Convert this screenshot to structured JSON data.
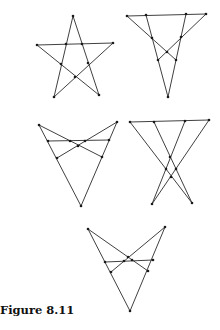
{
  "caption": "Figure 8.11",
  "colors": {
    "line": "#2a2a2a",
    "point": "#1a1a1a",
    "background": "#ffffff"
  },
  "figures": [
    {
      "name": "pentagram",
      "lines": [
        [
          73,
          16,
          54,
          97
        ],
        [
          73,
          16,
          99,
          95
        ],
        [
          37,
          45,
          113,
          43
        ],
        [
          37,
          45,
          99,
          95
        ],
        [
          54,
          97,
          113,
          43
        ]
      ],
      "points": [
        [
          73,
          16
        ],
        [
          37,
          45
        ],
        [
          113,
          43
        ],
        [
          54,
          97
        ],
        [
          99,
          95
        ],
        [
          66,
          44
        ],
        [
          82,
          44
        ],
        [
          61,
          64
        ],
        [
          88,
          63
        ],
        [
          75,
          77
        ]
      ]
    },
    {
      "name": "inverted-triangle-crossed",
      "lines": [
        [
          127,
          16,
          206,
          14
        ],
        [
          146,
          15,
          168,
          97
        ],
        [
          186,
          14,
          168,
          97
        ],
        [
          127,
          16,
          176,
          60
        ],
        [
          206,
          14,
          158,
          60
        ]
      ],
      "points": [
        [
          127,
          16
        ],
        [
          146,
          15
        ],
        [
          186,
          14
        ],
        [
          206,
          14
        ],
        [
          152,
          38
        ],
        [
          181,
          37
        ],
        [
          167,
          52
        ],
        [
          158,
          60
        ],
        [
          176,
          60
        ],
        [
          168,
          97
        ]
      ]
    },
    {
      "name": "bowtie-triangle-left",
      "lines": [
        [
          39,
          125,
          81,
          206
        ],
        [
          117,
          122,
          81,
          206
        ],
        [
          48,
          141,
          109,
          140
        ],
        [
          39,
          125,
          102,
          157
        ],
        [
          117,
          122,
          57,
          158
        ]
      ],
      "points": [
        [
          39,
          125
        ],
        [
          117,
          122
        ],
        [
          48,
          141
        ],
        [
          109,
          140
        ],
        [
          70,
          141
        ],
        [
          85,
          141
        ],
        [
          78,
          146
        ],
        [
          57,
          158
        ],
        [
          102,
          157
        ],
        [
          81,
          206
        ]
      ]
    },
    {
      "name": "crossed-legs",
      "lines": [
        [
          130,
          122,
          209,
          120
        ],
        [
          130,
          122,
          192,
          203
        ],
        [
          154,
          122,
          192,
          203
        ],
        [
          185,
          121,
          152,
          204
        ],
        [
          209,
          120,
          152,
          204
        ]
      ],
      "points": [
        [
          130,
          122
        ],
        [
          154,
          122
        ],
        [
          185,
          121
        ],
        [
          209,
          120
        ],
        [
          170,
          157
        ],
        [
          166,
          169
        ],
        [
          176,
          169
        ],
        [
          171,
          177
        ],
        [
          152,
          204
        ],
        [
          192,
          203
        ]
      ]
    },
    {
      "name": "bowtie-triangle-bottom",
      "lines": [
        [
          88,
          229,
          130,
          311
        ],
        [
          165,
          227,
          130,
          311
        ],
        [
          105,
          262,
          153,
          260
        ],
        [
          88,
          229,
          148,
          271
        ],
        [
          165,
          227,
          111,
          272
        ]
      ],
      "points": [
        [
          88,
          229
        ],
        [
          165,
          227
        ],
        [
          105,
          262
        ],
        [
          153,
          260
        ],
        [
          124,
          261
        ],
        [
          132,
          260
        ],
        [
          128,
          257
        ],
        [
          111,
          272
        ],
        [
          148,
          271
        ],
        [
          130,
          311
        ]
      ]
    }
  ]
}
